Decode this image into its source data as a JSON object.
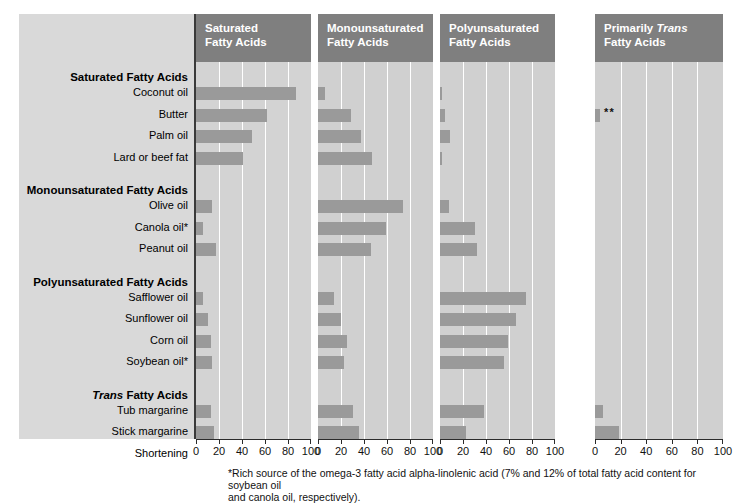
{
  "chart_data": {
    "type": "bar",
    "title": "",
    "subtitle": "",
    "xlabel": "",
    "ylabel": "",
    "xlim": [
      0,
      100
    ],
    "xticks": [
      0,
      20,
      40,
      60,
      80,
      100
    ],
    "xtick_labels": [
      "0",
      "20",
      "40",
      "60",
      "80",
      "100"
    ],
    "grid": true,
    "legend": "none",
    "orientation": "horizontal",
    "panels": [
      {
        "name": "saturated",
        "title_line1": "Saturated",
        "title_line2": "Fatty Acids",
        "title_italic_word": ""
      },
      {
        "name": "monounsaturated",
        "title_line1": "Monounsaturated",
        "title_line2": "Fatty Acids",
        "title_italic_word": ""
      },
      {
        "name": "polyunsaturated",
        "title_line1": "Polyunsaturated",
        "title_line2": "Fatty Acids",
        "title_italic_word": ""
      },
      {
        "name": "primarily-trans",
        "title_line1": "Primarily ",
        "title_line2": "Fatty Acids",
        "title_italic_word": "Trans"
      }
    ],
    "groups": [
      {
        "heading": "Saturated Fatty Acids",
        "heading_italic_word": "",
        "rows": [
          {
            "label": "Coconut oil",
            "saturated": 87,
            "monounsaturated": 6,
            "polyunsaturated": 2,
            "trans": 0,
            "trans_marker": ""
          },
          {
            "label": "Butter",
            "saturated": 62,
            "monounsaturated": 29,
            "polyunsaturated": 4,
            "trans": 4,
            "trans_marker": "**"
          },
          {
            "label": "Palm oil",
            "saturated": 49,
            "monounsaturated": 37,
            "polyunsaturated": 9,
            "trans": 0,
            "trans_marker": ""
          },
          {
            "label": "Lard or beef fat",
            "saturated": 41,
            "monounsaturated": 47,
            "polyunsaturated": 2,
            "trans": 0,
            "trans_marker": ""
          }
        ]
      },
      {
        "heading": "Monounsaturated Fatty Acids",
        "heading_italic_word": "",
        "rows": [
          {
            "label": "Olive oil",
            "saturated": 14,
            "monounsaturated": 74,
            "polyunsaturated": 8,
            "trans": 0,
            "trans_marker": ""
          },
          {
            "label": "Canola oil*",
            "saturated": 6,
            "monounsaturated": 59,
            "polyunsaturated": 30,
            "trans": 0,
            "trans_marker": ""
          },
          {
            "label": "Peanut oil",
            "saturated": 17,
            "monounsaturated": 46,
            "polyunsaturated": 32,
            "trans": 0,
            "trans_marker": ""
          }
        ]
      },
      {
        "heading": "Polyunsaturated Fatty Acids",
        "heading_italic_word": "",
        "rows": [
          {
            "label": "Safflower oil",
            "saturated": 6,
            "monounsaturated": 14,
            "polyunsaturated": 75,
            "trans": 0,
            "trans_marker": ""
          },
          {
            "label": "Sunflower oil",
            "saturated": 10,
            "monounsaturated": 20,
            "polyunsaturated": 66,
            "trans": 0,
            "trans_marker": ""
          },
          {
            "label": "Corn oil",
            "saturated": 13,
            "monounsaturated": 25,
            "polyunsaturated": 59,
            "trans": 0,
            "trans_marker": ""
          },
          {
            "label": "Soybean oil*",
            "saturated": 14,
            "monounsaturated": 23,
            "polyunsaturated": 56,
            "trans": 0,
            "trans_marker": ""
          }
        ]
      },
      {
        "heading": "Trans Fatty Acids",
        "heading_italic_word": "Trans",
        "rows": [
          {
            "label": "Tub margarine",
            "saturated": 13,
            "monounsaturated": 30,
            "polyunsaturated": 38,
            "trans": 6,
            "trans_marker": ""
          },
          {
            "label": "Stick margarine",
            "saturated": 16,
            "monounsaturated": 36,
            "polyunsaturated": 23,
            "trans": 19,
            "trans_marker": ""
          },
          {
            "label": "Shortening",
            "saturated": 20,
            "monounsaturated": 45,
            "polyunsaturated": 10,
            "trans": 24,
            "trans_marker": ""
          }
        ]
      }
    ]
  },
  "footnote": {
    "line1": "*Rich source of the omega-3 fatty acid alpha-linolenic acid (7% and 12% of total fatty acid content for soybean oil",
    "line2": "and canola oil, respectively)."
  },
  "colors": {
    "bar": "#9a9a9a",
    "panel_header": "#7f7f7f",
    "plot_background": "#d0d0d0",
    "label_background": "#d9d9d9",
    "gridline": "#ffffff",
    "axis": "#2b2b2b",
    "text": "#000000"
  }
}
